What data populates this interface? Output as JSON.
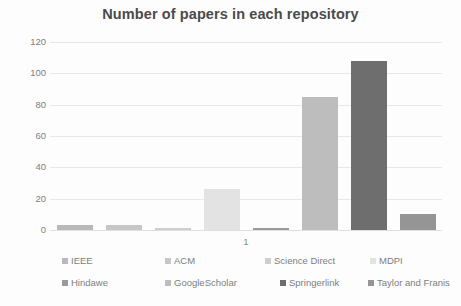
{
  "chart_data": {
    "type": "bar",
    "title": "Number of papers in each repository",
    "xlabel": "",
    "ylabel": "",
    "categories": [
      "1"
    ],
    "x_tick_labels": [
      "1"
    ],
    "y_tick_labels": [
      "0",
      "20",
      "40",
      "60",
      "80",
      "100",
      "120"
    ],
    "y_ticks": [
      0,
      20,
      40,
      60,
      80,
      100,
      120
    ],
    "ylim": [
      0,
      120
    ],
    "grid": true,
    "legend_position": "bottom",
    "series": [
      {
        "name": "IEEE",
        "values": [
          3
        ],
        "color": "#b9b9b9"
      },
      {
        "name": "ACM",
        "values": [
          3
        ],
        "color": "#c7c7c7"
      },
      {
        "name": "Science Direct",
        "values": [
          1
        ],
        "color": "#cfcfcf"
      },
      {
        "name": "MDPI",
        "values": [
          26
        ],
        "color": "#e3e3e3"
      },
      {
        "name": "Hindawe",
        "values": [
          1
        ],
        "color": "#9a9a9a"
      },
      {
        "name": "GoogleScholar",
        "values": [
          85
        ],
        "color": "#bdbdbd"
      },
      {
        "name": "Springerlink",
        "values": [
          108
        ],
        "color": "#6e6e6e"
      },
      {
        "name": "Taylor and Franis",
        "values": [
          10
        ],
        "color": "#959595"
      }
    ]
  },
  "legend": {
    "rows": [
      [
        {
          "label": "IEEE",
          "color": "#b9b9b9"
        },
        {
          "label": "ACM",
          "color": "#c7c7c7"
        },
        {
          "label": "Science Direct",
          "color": "#cfcfcf"
        },
        {
          "label": "MDPI",
          "color": "#e3e3e3"
        }
      ],
      [
        {
          "label": "Hindawe",
          "color": "#9a9a9a"
        },
        {
          "label": "GoogleScholar",
          "color": "#bdbdbd"
        },
        {
          "label": "Springerlink",
          "color": "#6e6e6e"
        },
        {
          "label": "Taylor and Franis",
          "color": "#959595"
        }
      ]
    ]
  },
  "style": {
    "background": "#fdfdfd",
    "title_color": "#4a4a4a",
    "tick_color": "#808080",
    "grid_color": "#e8e8e8"
  }
}
